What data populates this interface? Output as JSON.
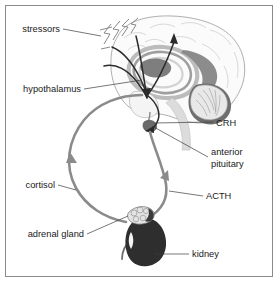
{
  "figure": {
    "background_color": "#ffffff",
    "border_color": "#8a8a8a"
  },
  "labels": {
    "stressors": "stressors",
    "hypothalamus": "hypothalamus",
    "cortisol": "cortisol",
    "adrenal_gland": "adrenal gland",
    "crh": "CRH",
    "anterior_pituitary_line1": "anterior",
    "anterior_pituitary_line2": "pituitary",
    "acth": "ACTH",
    "kidney": "kidney"
  },
  "colors": {
    "hormone_path": "#8b8b8b",
    "neural_path": "#2b2b2b",
    "kidney": "#2e2e2e",
    "adrenal": "#e3e3e3",
    "brain_fill": "#fbfbfb",
    "text": "#1a1a1a",
    "leader_line": "#3c3c3c"
  },
  "structures": [
    {
      "name": "brain",
      "description": "midsagittal brain section with cortex, corpus callosum, thalamus, brainstem and cerebellum"
    },
    {
      "name": "cerebellum",
      "description": "foliated cerebellum at posterior-inferior brain"
    },
    {
      "name": "anterior-pituitary",
      "description": "small gland below hypothalamus at base of brain"
    },
    {
      "name": "adrenal-gland",
      "description": "light lobulated cap sitting on superior pole of kidney"
    },
    {
      "name": "kidney",
      "description": "dark bean-shaped kidney with ureter"
    }
  ],
  "pathways": [
    {
      "name": "stressors-to-hypothalamus",
      "type": "neural",
      "style": "dark arrows converging on hypothalamus"
    },
    {
      "name": "crh-hypothalamus-to-pituitary",
      "type": "neural",
      "style": "dark curve descending to anterior pituitary"
    },
    {
      "name": "acth-pituitary-to-adrenal",
      "type": "hormone",
      "style": "gray arrow curving down to adrenal gland"
    },
    {
      "name": "cortisol-adrenal-to-brain",
      "type": "hormone",
      "style": "gray arrow curving up to hypothalamus"
    }
  ]
}
